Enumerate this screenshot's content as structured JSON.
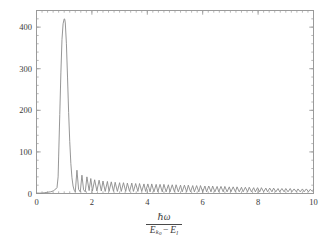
{
  "figure": {
    "background_color": "#ffffff",
    "line_color": "#8a8a8a",
    "frame_color": "#9a9a9a",
    "text_color": "#3a3a3a"
  },
  "axis_label": {
    "numerator_hbar": "ℏ",
    "numerator_omega": "ω",
    "denominator_E1": "E",
    "denominator_E1_sub": "k",
    "denominator_E1_sub2": "0",
    "denominator_operator": "−",
    "denominator_E2": "E",
    "denominator_E2_sub": "l",
    "plain_text": "ℏω / (E_k0 − E_l)"
  },
  "chart_data": {
    "type": "line",
    "title": "",
    "xlabel": "ℏω / (E_k0 − E_l)",
    "ylabel": "",
    "xlim": [
      0,
      10
    ],
    "ylim": [
      0,
      440
    ],
    "grid": false,
    "legend": null,
    "x_ticks": [
      0,
      2,
      4,
      6,
      8,
      10
    ],
    "x_tick_labels": [
      "0",
      "2",
      "4",
      "6",
      "8",
      "10"
    ],
    "x_minor_step": 0.2,
    "y_ticks": [
      0,
      100,
      200,
      300,
      400
    ],
    "y_tick_labels": [
      "0",
      "100",
      "200",
      "300",
      "400"
    ],
    "y_minor_step": 20,
    "peak": {
      "x": 1.02,
      "y": 420
    },
    "onset_x": 0.75,
    "secondary_peak": {
      "x": 1.46,
      "y": 56
    },
    "oscillation_period": 0.44,
    "tail_amplitude_at_x10": 9,
    "series": [
      {
        "name": "spectrum",
        "x": [
          0.0,
          0.1,
          0.2,
          0.3,
          0.4,
          0.5,
          0.56,
          0.62,
          0.66,
          0.7,
          0.74,
          0.78,
          0.8,
          0.84,
          0.88,
          0.92,
          0.96,
          1.0,
          1.02,
          1.04,
          1.08,
          1.12,
          1.16,
          1.2,
          1.24,
          1.28,
          1.32,
          1.36,
          1.4,
          1.46,
          1.52,
          1.58,
          1.64,
          1.7,
          1.76,
          1.82,
          1.9,
          1.96,
          2.02,
          2.1,
          2.18,
          2.26,
          2.34,
          2.4,
          2.48,
          2.56,
          2.62,
          2.7,
          2.78,
          2.84,
          2.92,
          3.0,
          3.06,
          3.14,
          3.22,
          3.28,
          3.36,
          3.44,
          3.5,
          3.58,
          3.66,
          3.72,
          3.8,
          3.88,
          3.94,
          4.02,
          4.1,
          4.16,
          4.24,
          4.32,
          4.38,
          4.46,
          4.54,
          4.6,
          4.68,
          4.76,
          4.82,
          4.9,
          4.98,
          5.04,
          5.12,
          5.2,
          5.26,
          5.34,
          5.42,
          5.48,
          5.56,
          5.64,
          5.7,
          5.78,
          5.86,
          5.92,
          6.0,
          6.08,
          6.14,
          6.22,
          6.3,
          6.36,
          6.44,
          6.52,
          6.58,
          6.66,
          6.74,
          6.8,
          6.88,
          6.96,
          7.02,
          7.1,
          7.18,
          7.24,
          7.32,
          7.4,
          7.46,
          7.54,
          7.62,
          7.68,
          7.76,
          7.84,
          7.9,
          7.98,
          8.06,
          8.12,
          8.2,
          8.28,
          8.34,
          8.42,
          8.5,
          8.56,
          8.64,
          8.72,
          8.78,
          8.86,
          8.94,
          9.0,
          9.08,
          9.16,
          9.22,
          9.3,
          9.38,
          9.44,
          9.52,
          9.6,
          9.66,
          9.74,
          9.82,
          9.88,
          9.96,
          10.0
        ],
        "y": [
          1,
          1,
          1,
          2,
          3,
          4,
          5,
          7,
          9,
          11,
          14,
          40,
          90,
          190,
          290,
          370,
          408,
          420,
          419,
          410,
          360,
          280,
          195,
          125,
          72,
          38,
          18,
          8,
          4,
          56,
          10,
          4,
          44,
          9,
          4,
          40,
          7,
          36,
          6,
          33,
          6,
          32,
          6,
          30,
          5,
          29,
          5,
          28,
          5,
          27,
          5,
          26,
          5,
          26,
          5,
          25,
          5,
          25,
          5,
          24,
          5,
          24,
          5,
          23,
          5,
          23,
          4,
          23,
          4,
          22,
          4,
          22,
          4,
          22,
          4,
          21,
          4,
          21,
          4,
          21,
          4,
          20,
          4,
          20,
          4,
          20,
          4,
          19,
          4,
          19,
          4,
          19,
          4,
          18,
          4,
          18,
          4,
          18,
          4,
          17,
          4,
          17,
          4,
          17,
          4,
          16,
          4,
          16,
          4,
          16,
          4,
          15,
          4,
          15,
          4,
          15,
          4,
          14,
          4,
          14,
          4,
          14,
          4,
          13,
          4,
          13,
          4,
          13,
          4,
          12,
          4,
          12,
          4,
          12,
          4,
          12,
          4,
          11,
          4,
          11,
          4,
          11,
          4,
          11,
          4,
          10,
          5,
          10
        ]
      }
    ]
  }
}
